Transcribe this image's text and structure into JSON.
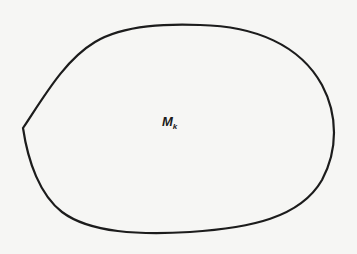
{
  "diagram": {
    "type": "closed-region",
    "region": {
      "label_main": "M",
      "label_subscript": "k"
    },
    "shape": {
      "stroke_color": "#1c1c1c",
      "fill_color": "none",
      "stroke_width": 2.2,
      "cusp_point": [
        23,
        128
      ],
      "top_extreme": [
        195,
        25
      ],
      "right_extreme": [
        334,
        128
      ],
      "bottom_extreme": [
        160,
        233
      ]
    },
    "background_color": "#f6f6f4"
  }
}
